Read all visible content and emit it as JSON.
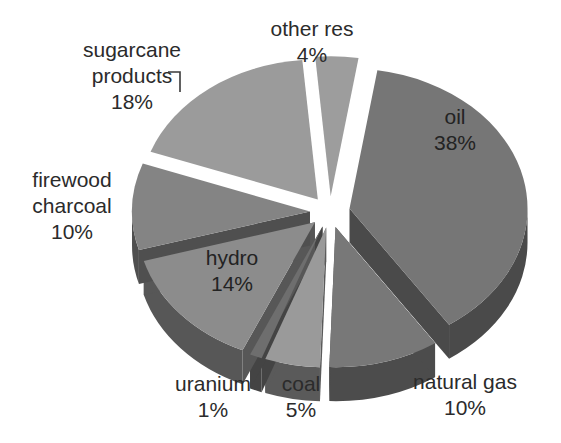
{
  "chart_data": {
    "type": "pie",
    "title": "",
    "subtitle": "",
    "xlabel": "",
    "ylabel": "",
    "legend_position": "none",
    "grid": false,
    "style": "exploded 3D pie, grayscale",
    "background_color": "#ffffff",
    "categories": [
      "oil",
      "natural gas",
      "coal",
      "uranium",
      "hydro",
      "firewood charcoal",
      "sugarcane products",
      "other res"
    ],
    "values": [
      38,
      10,
      5,
      1,
      14,
      10,
      18,
      4
    ],
    "value_unit": "%",
    "slices": [
      {
        "name": "oil",
        "label_line1": "oil",
        "label_line2": "38%",
        "value": 38,
        "value_text": "38%",
        "top_color": "#767676",
        "side_color": "#4a4a4a",
        "label_placement": "inside",
        "label_x": 455,
        "label_y": 124,
        "start_angle": -81,
        "end_angle": 56,
        "explode": 20,
        "leader": false
      },
      {
        "name": "natural gas",
        "label_line1": "natural gas",
        "label_line2": "10%",
        "value": 10,
        "value_text": "10%",
        "top_color": "#787878",
        "side_color": "#4c4c4c",
        "label_placement": "outside",
        "label_x": 465,
        "label_y": 389,
        "start_angle": 56,
        "end_angle": 92,
        "explode": 20,
        "leader": false
      },
      {
        "name": "coal",
        "label_line1": "coal",
        "label_line2": "5%",
        "value": 5,
        "value_text": "5%",
        "top_color": "#9a9a9a",
        "side_color": "#5a5a5a",
        "label_placement": "outside",
        "label_x": 301,
        "label_y": 391,
        "start_angle": 92,
        "end_angle": 110,
        "explode": 20,
        "leader": false
      },
      {
        "name": "uranium",
        "label_line1": "uranium",
        "label_line2": "1%",
        "value": 1,
        "value_text": "1%",
        "top_color": "#6e6e6e",
        "side_color": "#444444",
        "label_placement": "outside",
        "label_x": 213,
        "label_y": 391,
        "start_angle": 110,
        "end_angle": 114,
        "explode": 20,
        "leader": false
      },
      {
        "name": "hydro",
        "label_line1": "hydro",
        "label_line2": "14%",
        "value": 14,
        "value_text": "14%",
        "top_color": "#8c8c8c",
        "side_color": "#575757",
        "label_placement": "inside",
        "label_x": 232,
        "label_y": 265,
        "start_angle": 114,
        "end_angle": 164,
        "explode": 20,
        "leader": false
      },
      {
        "name": "firewood charcoal",
        "label_line1": "firewood",
        "label_line2": "charcoal",
        "label_line3": "10%",
        "value": 10,
        "value_text": "10%",
        "top_color": "#848484",
        "side_color": "#4f4f4f",
        "label_placement": "outside",
        "label_x": 72,
        "label_y": 187,
        "start_angle": 164,
        "end_angle": 200,
        "explode": 20,
        "leader": false
      },
      {
        "name": "sugarcane products",
        "label_line1": "sugarcane",
        "label_line2": "products",
        "label_line3": "18%",
        "value": 18,
        "value_text": "18%",
        "top_color": "#9b9b9b",
        "side_color": "#5c5c5c",
        "label_placement": "outside",
        "label_x": 132,
        "label_y": 57,
        "start_angle": 200,
        "end_angle": 265,
        "explode": 20,
        "leader": true
      },
      {
        "name": "other res",
        "label_line1": "other res",
        "label_line2": "4%",
        "value": 4,
        "value_text": "4%",
        "top_color": "#9d9d9d",
        "side_color": "#565656",
        "label_placement": "outside",
        "label_x": 312,
        "label_y": 36,
        "start_angle": 265,
        "end_angle": 279,
        "explode": 20,
        "leader": false
      }
    ],
    "geometry": {
      "center_x": 330,
      "center_y": 212,
      "radius_x": 178,
      "radius_y": 140,
      "depth": 34,
      "rotation_deg": -81
    }
  }
}
